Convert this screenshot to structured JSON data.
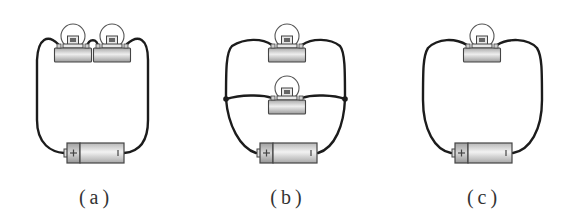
{
  "figure": {
    "colors": {
      "wire": "#1c1c1c",
      "component_fill": "#cfcfcf",
      "background": "#ffffff"
    },
    "panels": [
      {
        "id": "a",
        "label": "(a)",
        "arrangement": "series",
        "bulb_count": 2,
        "battery": {
          "positive_sign": "+",
          "negative_sign": "|"
        }
      },
      {
        "id": "b",
        "label": "(b)",
        "arrangement": "parallel",
        "bulb_count": 2,
        "junctions": 2,
        "battery": {
          "positive_sign": "+",
          "negative_sign": "|"
        }
      },
      {
        "id": "c",
        "label": "(c)",
        "arrangement": "single",
        "bulb_count": 1,
        "battery": {
          "positive_sign": "+",
          "negative_sign": "|"
        }
      }
    ]
  }
}
